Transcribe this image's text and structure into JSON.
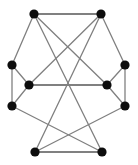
{
  "figure": {
    "width": 138,
    "height": 165,
    "background_color": "#ffffff",
    "edge_color": "#808080",
    "vertex_color": "#0d0d0d",
    "vertex_radius": 4.6
  },
  "graph_data": {
    "type": "node-link-diagram",
    "directed": false,
    "vertex_count": 10,
    "edge_count": 15,
    "vertices": [
      {
        "id": "top-left",
        "name": "vertex-top-left",
        "x": 34,
        "y": 14
      },
      {
        "id": "top-right",
        "name": "vertex-top-right",
        "x": 101,
        "y": 14
      },
      {
        "id": "left-upper",
        "name": "vertex-left-upper",
        "x": 12,
        "y": 65
      },
      {
        "id": "left-middle",
        "name": "vertex-left-middle",
        "x": 29,
        "y": 85
      },
      {
        "id": "left-lower",
        "name": "vertex-left-lower",
        "x": 12,
        "y": 106
      },
      {
        "id": "right-upper",
        "name": "vertex-right-upper",
        "x": 125,
        "y": 65
      },
      {
        "id": "right-middle",
        "name": "vertex-right-middle",
        "x": 107,
        "y": 85
      },
      {
        "id": "right-lower",
        "name": "vertex-right-lower",
        "x": 125,
        "y": 106
      },
      {
        "id": "bottom-left",
        "name": "vertex-bottom-left",
        "x": 35,
        "y": 152
      },
      {
        "id": "bottom-right",
        "name": "vertex-bottom-right",
        "x": 102,
        "y": 152
      }
    ],
    "edges": [
      {
        "source": "top-left",
        "target": "top-right",
        "name": "edge-top-horizontal",
        "weight": "thick"
      },
      {
        "source": "top-left",
        "target": "left-upper",
        "name": "edge-top-left-to-left-upper"
      },
      {
        "source": "top-right",
        "target": "right-upper",
        "name": "edge-top-right-to-right-upper"
      },
      {
        "source": "top-left",
        "target": "right-middle",
        "name": "edge-top-left-to-right-middle"
      },
      {
        "source": "top-right",
        "target": "left-middle",
        "name": "edge-top-right-to-left-middle"
      },
      {
        "source": "top-left",
        "target": "bottom-right",
        "name": "edge-top-left-to-bottom-right"
      },
      {
        "source": "top-right",
        "target": "bottom-left",
        "name": "edge-top-right-to-bottom-left"
      },
      {
        "source": "left-upper",
        "target": "left-middle",
        "name": "edge-left-upper-to-left-middle"
      },
      {
        "source": "left-upper",
        "target": "left-lower",
        "name": "edge-left-vertical"
      },
      {
        "source": "left-middle",
        "target": "left-lower",
        "name": "edge-left-middle-to-left-lower"
      },
      {
        "source": "left-middle",
        "target": "right-middle",
        "name": "edge-middle-horizontal",
        "weight": "thick"
      },
      {
        "source": "right-upper",
        "target": "right-middle",
        "name": "edge-right-upper-to-right-middle"
      },
      {
        "source": "right-upper",
        "target": "right-lower",
        "name": "edge-right-vertical"
      },
      {
        "source": "right-middle",
        "target": "right-lower",
        "name": "edge-right-middle-to-right-lower"
      },
      {
        "source": "left-lower",
        "target": "bottom-right",
        "name": "edge-left-lower-to-bottom-right"
      },
      {
        "source": "right-lower",
        "target": "bottom-left",
        "name": "edge-right-lower-to-bottom-left"
      },
      {
        "source": "bottom-left",
        "target": "bottom-right",
        "name": "edge-bottom-horizontal",
        "weight": "thick"
      }
    ]
  }
}
